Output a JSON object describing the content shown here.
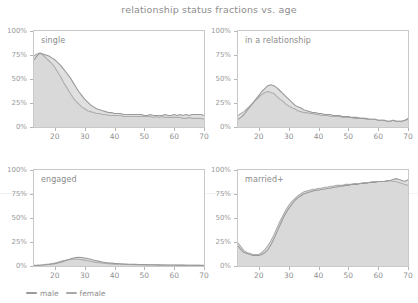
{
  "header": {
    "title": "relationship status fractions vs. age"
  },
  "legend": {
    "position": "bottom-left",
    "items": [
      {
        "label": "male",
        "color": "#9a9a9a",
        "swatch_name": "legend-swatch-male"
      },
      {
        "label": "female",
        "color": "#a8a8a8",
        "swatch_name": "legend-swatch-female"
      }
    ]
  },
  "axes": {
    "y_ticks": [
      "0%",
      "25%",
      "50%",
      "75%",
      "100%"
    ],
    "y_tick_values": [
      0,
      25,
      50,
      75,
      100
    ],
    "x_ticks": [
      "20",
      "30",
      "40",
      "50",
      "60",
      "70"
    ],
    "x_tick_values": [
      20,
      30,
      40,
      50,
      60,
      70
    ],
    "xlim": [
      13,
      70
    ],
    "ylim": [
      0,
      100
    ],
    "xlabel": "",
    "ylabel": "",
    "grid": false
  },
  "colors": {
    "male_line": "#9a9a9a",
    "female_line": "#adadad",
    "male_fill": "#d6d6d6",
    "female_fill": "#e3e3e3",
    "axis": "#c9c9c9",
    "text": "#8d8d8d",
    "background": "#ffffff"
  },
  "panels": [
    {
      "label": "single",
      "name": "panel-single"
    },
    {
      "label": "in a relationship",
      "name": "panel-in-a-relationship"
    },
    {
      "label": "engaged",
      "name": "panel-engaged"
    },
    {
      "label": "married+",
      "name": "panel-married-plus"
    }
  ],
  "chart_data": {
    "type": "area",
    "title": "relationship status fractions vs. age",
    "xlabel": "age",
    "ylabel": "fraction",
    "xlim": [
      13,
      70
    ],
    "ylim": [
      0,
      100
    ],
    "grid": false,
    "legend": [
      "male",
      "female"
    ],
    "legend_position": "bottom-left",
    "x": [
      13,
      14,
      15,
      16,
      17,
      18,
      19,
      20,
      21,
      22,
      23,
      24,
      25,
      26,
      27,
      28,
      29,
      30,
      31,
      32,
      33,
      34,
      35,
      36,
      37,
      38,
      39,
      40,
      41,
      42,
      43,
      44,
      45,
      46,
      47,
      48,
      49,
      50,
      51,
      52,
      53,
      54,
      55,
      56,
      57,
      58,
      59,
      60,
      61,
      62,
      63,
      64,
      65,
      66,
      67,
      68,
      69,
      70
    ],
    "panels": [
      {
        "label": "single",
        "type": "area",
        "series": [
          {
            "name": "male",
            "values": [
              70,
              74,
              77,
              76,
              75,
              74,
              72,
              70,
              67,
              64,
              60,
              56,
              52,
              47,
              42,
              37,
              33,
              29,
              26,
              23,
              21,
              19,
              18,
              17,
              16,
              15,
              15,
              14,
              14,
              14,
              13,
              13,
              13,
              13,
              13,
              13,
              13,
              12,
              12,
              13,
              12,
              12,
              12,
              12,
              13,
              12,
              12,
              13,
              12,
              13,
              12,
              13,
              12,
              13,
              13,
              13,
              13,
              12
            ]
          },
          {
            "name": "female",
            "values": [
              74,
              76,
              77,
              75,
              72,
              69,
              66,
              62,
              57,
              52,
              46,
              41,
              36,
              31,
              27,
              24,
              21,
              19,
              17,
              16,
              15,
              14,
              14,
              13,
              13,
              12,
              12,
              12,
              12,
              12,
              11,
              11,
              11,
              11,
              11,
              11,
              11,
              11,
              11,
              11,
              10,
              11,
              10,
              11,
              10,
              10,
              10,
              10,
              10,
              10,
              9,
              9,
              10,
              9,
              9,
              9,
              9,
              8
            ]
          }
        ]
      },
      {
        "label": "in a relationship",
        "type": "area",
        "series": [
          {
            "name": "male",
            "values": [
              8,
              10,
              13,
              17,
              21,
              25,
              29,
              33,
              37,
              40,
              43,
              44,
              43,
              41,
              38,
              35,
              32,
              29,
              26,
              23,
              21,
              20,
              18,
              17,
              16,
              15,
              15,
              14,
              14,
              13,
              13,
              13,
              12,
              12,
              12,
              11,
              11,
              11,
              10,
              10,
              10,
              9,
              9,
              9,
              8,
              8,
              8,
              7,
              7,
              7,
              6,
              6,
              7,
              6,
              6,
              6,
              7,
              9
            ]
          },
          {
            "name": "female",
            "values": [
              12,
              14,
              16,
              19,
              22,
              25,
              28,
              31,
              34,
              36,
              37,
              36,
              35,
              32,
              29,
              27,
              24,
              22,
              20,
              19,
              17,
              16,
              15,
              15,
              14,
              14,
              13,
              13,
              12,
              12,
              12,
              11,
              11,
              11,
              11,
              10,
              10,
              10,
              10,
              9,
              9,
              9,
              9,
              8,
              8,
              8,
              8,
              7,
              7,
              7,
              6,
              6,
              7,
              6,
              6,
              6,
              7,
              8
            ]
          }
        ]
      },
      {
        "label": "engaged",
        "type": "area",
        "series": [
          {
            "name": "male",
            "values": [
              0.5,
              0.6,
              0.8,
              1,
              1.3,
              1.6,
              2,
              2.5,
              3.2,
              4,
              5,
              6,
              7,
              8,
              8.8,
              9,
              8.8,
              8.4,
              7.8,
              7,
              6.2,
              5.5,
              4.8,
              4.2,
              3.7,
              3.3,
              3,
              2.7,
              2.5,
              2.3,
              2.1,
              2,
              1.9,
              1.8,
              1.7,
              1.6,
              1.5,
              1.5,
              1.4,
              1.3,
              1.3,
              1.2,
              1.2,
              1.1,
              1.1,
              1,
              1,
              1,
              0.9,
              0.9,
              0.9,
              0.8,
              0.8,
              0.8,
              0.8,
              0.7,
              0.7,
              0.7
            ]
          },
          {
            "name": "female",
            "values": [
              0.6,
              0.8,
              1,
              1.3,
              1.7,
              2.1,
              2.6,
              3.2,
              4,
              4.8,
              5.6,
              6.3,
              6.9,
              7.2,
              7.2,
              7,
              6.6,
              6.1,
              5.5,
              4.9,
              4.3,
              3.8,
              3.4,
              3,
              2.7,
              2.4,
              2.2,
              2,
              1.9,
              1.8,
              1.7,
              1.6,
              1.5,
              1.4,
              1.4,
              1.3,
              1.2,
              1.2,
              1.1,
              1.1,
              1,
              1,
              0.9,
              0.9,
              0.9,
              0.8,
              0.8,
              0.8,
              0.7,
              0.7,
              0.7,
              0.7,
              0.6,
              0.6,
              0.6,
              0.6,
              0.5,
              0.5
            ]
          },
          {
            "name": "male",
            "peak_value": 9,
            "peak_age": 27
          }
        ]
      },
      {
        "label": "married+",
        "type": "area",
        "series": [
          {
            "name": "male",
            "values": [
              21,
              17,
              14,
              13,
              12,
              11,
              11,
              11,
              12,
              14,
              17,
              22,
              28,
              35,
              42,
              49,
              55,
              60,
              64,
              68,
              71,
              73,
              75,
              76,
              77,
              78,
              79,
              79,
              80,
              80,
              81,
              81,
              82,
              82,
              83,
              83,
              84,
              84,
              85,
              85,
              85,
              86,
              86,
              86,
              87,
              87,
              87,
              88,
              88,
              88,
              89,
              89,
              90,
              91,
              90,
              89,
              88,
              90
            ]
          },
          {
            "name": "female",
            "values": [
              24,
              20,
              16,
              14,
              13,
              12,
              12,
              12,
              14,
              17,
              21,
              26,
              32,
              39,
              46,
              52,
              58,
              63,
              67,
              70,
              73,
              75,
              77,
              78,
              79,
              80,
              80,
              81,
              81,
              82,
              82,
              83,
              83,
              84,
              84,
              84,
              85,
              85,
              85,
              86,
              86,
              86,
              87,
              87,
              87,
              88,
              88,
              88,
              88,
              88,
              88,
              89,
              88,
              88,
              87,
              86,
              85,
              84
            ]
          }
        ]
      }
    ]
  }
}
